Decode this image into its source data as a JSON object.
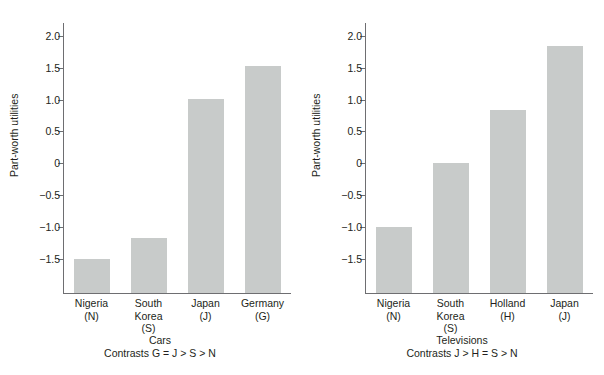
{
  "chart_data": [
    {
      "type": "bar",
      "title": "Cars",
      "subtitle": "Contrasts G = J > S > N",
      "xlabel": "",
      "ylabel": "Part-worth utilities",
      "categories": [
        "Nigeria\n(N)",
        "South\nKorea\n(S)",
        "Japan\n(J)",
        "Germany\n(G)"
      ],
      "category_names": [
        "Nigeria",
        "South Korea",
        "Japan",
        "Germany"
      ],
      "category_codes": [
        "N",
        "S",
        "J",
        "G"
      ],
      "values": [
        -1.5,
        -1.17,
        1.01,
        1.52
      ],
      "ylim": [
        -2.05,
        2.2
      ],
      "yticks": [
        2.0,
        1.5,
        1.0,
        0.5,
        0,
        -0.5,
        -1.0,
        -1.5
      ],
      "yticklabels": [
        "2.0",
        "1.5",
        "1.0",
        "0.5",
        "0",
        "−0.5",
        "−1.0",
        "−1.5"
      ],
      "grid": false,
      "legend": "none",
      "bar_color": "#c8cbca",
      "axis_color": "#6e6e71"
    },
    {
      "type": "bar",
      "title": "Televisions",
      "subtitle": "Contrasts J > H = S > N",
      "xlabel": "",
      "ylabel": "Part-worth utilities",
      "categories": [
        "Nigeria\n(N)",
        "South\nKorea\n(S)",
        "Holland\n(H)",
        "Japan\n(J)"
      ],
      "category_names": [
        "Nigeria",
        "South Korea",
        "Holland",
        "Japan"
      ],
      "category_codes": [
        "N",
        "S",
        "H",
        "J"
      ],
      "values": [
        -1.0,
        0.0,
        0.84,
        1.84
      ],
      "ylim": [
        -2.05,
        2.2
      ],
      "yticks": [
        2.0,
        1.5,
        1.0,
        0.5,
        0,
        -0.5,
        -1.0,
        -1.5
      ],
      "yticklabels": [
        "2.0",
        "1.5",
        "1.0",
        "0.5",
        "0",
        "−0.5",
        "−1.0",
        "−1.5"
      ],
      "grid": false,
      "legend": "none",
      "bar_color": "#c8cbca",
      "axis_color": "#6e6e71"
    }
  ]
}
